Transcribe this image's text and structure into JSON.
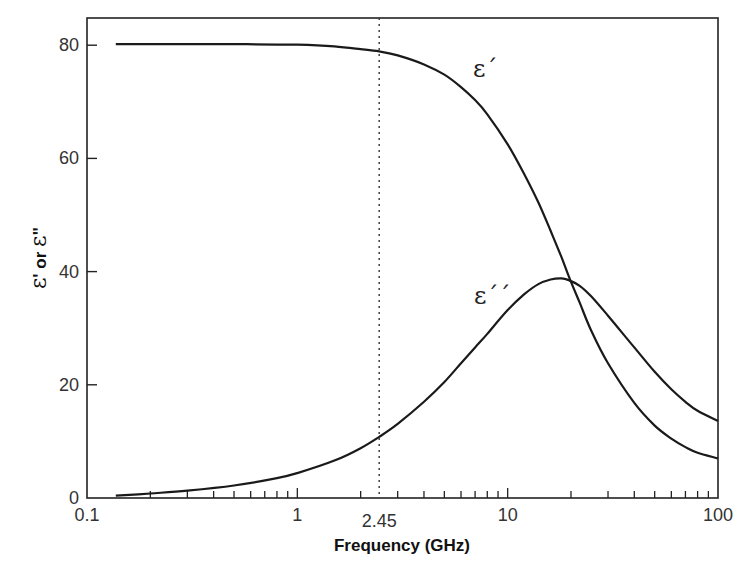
{
  "chart_data": {
    "type": "line",
    "title": "",
    "xlabel": "Frequency (GHz)",
    "ylabel": "ε' or ε\"",
    "xscale": "log",
    "xlim": [
      0.1,
      100
    ],
    "ylim": [
      0,
      84.8
    ],
    "x_ticks": [
      {
        "value": 0.1,
        "label": "0.1"
      },
      {
        "value": 1,
        "label": "1"
      },
      {
        "value": 2.45,
        "label": "2.45"
      },
      {
        "value": 10,
        "label": "10"
      },
      {
        "value": 100,
        "label": "100"
      }
    ],
    "y_ticks": [
      {
        "value": 0,
        "label": "0"
      },
      {
        "value": 20,
        "label": "20"
      },
      {
        "value": 40,
        "label": "40"
      },
      {
        "value": 60,
        "label": "60"
      },
      {
        "value": 80,
        "label": "80"
      }
    ],
    "grid": false,
    "legend": "none (inline curve labels)",
    "annotations": [
      {
        "type": "vertical-dotted-line",
        "x": 2.45
      },
      {
        "type": "curve-label",
        "text": "ε´",
        "x": 13,
        "y": 76
      },
      {
        "type": "curve-label",
        "text": "ε´´",
        "x": 13,
        "y": 38
      }
    ],
    "series": [
      {
        "name": "ε´ (dielectric constant)",
        "x": [
          0.137,
          0.2,
          0.3,
          0.5,
          0.8,
          1.0,
          1.5,
          2.0,
          2.45,
          3.0,
          4.0,
          5.0,
          6.0,
          7.0,
          8.0,
          10.0,
          12.0,
          14.0,
          16.0,
          18.0,
          19.5,
          22,
          25,
          30,
          40,
          50,
          60,
          70,
          80,
          100
        ],
        "values": [
          80.2,
          80.2,
          80.2,
          80.2,
          80.1,
          80.1,
          79.8,
          79.3,
          78.9,
          78.2,
          76.6,
          74.8,
          72.6,
          70.3,
          67.8,
          62.5,
          57.2,
          52.2,
          47.2,
          42.6,
          39.2,
          34.5,
          29.5,
          23.8,
          16.8,
          12.8,
          10.5,
          9.0,
          8.0,
          7.0
        ]
      },
      {
        "name": "ε´´ (dielectric loss)",
        "x": [
          0.137,
          0.2,
          0.3,
          0.5,
          0.8,
          1.0,
          1.5,
          2.0,
          2.45,
          3.0,
          4.0,
          5.0,
          6.0,
          7.0,
          8.0,
          10.0,
          12.0,
          14.0,
          16.0,
          18.0,
          19.5,
          22,
          25,
          30,
          40,
          50,
          60,
          70,
          80,
          100
        ],
        "values": [
          0.4,
          0.8,
          1.3,
          2.2,
          3.5,
          4.4,
          6.6,
          8.8,
          10.8,
          13.1,
          17.0,
          20.5,
          23.8,
          26.6,
          29.0,
          33.2,
          36.0,
          37.8,
          38.6,
          38.8,
          38.5,
          37.5,
          35.6,
          32.2,
          26.6,
          22.3,
          19.2,
          17.0,
          15.4,
          13.6
        ]
      }
    ]
  },
  "axes": {
    "x_title": "Frequency (GHz)",
    "y_title_parts": [
      "ε",
      "'",
      " or ",
      "ε",
      "\""
    ]
  },
  "labels": {
    "eps_prime": "ε´",
    "eps_double_prime": "ε´´"
  },
  "style": {
    "line_color": "#1a1a1a",
    "axis_color": "#222222",
    "background": "#ffffff"
  }
}
